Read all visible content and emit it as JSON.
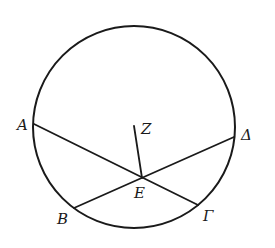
{
  "diagram": {
    "type": "geometry",
    "stroke_color": "#1a1a1a",
    "background": "#ffffff",
    "circle": {
      "cx": 134,
      "cy": 127,
      "r": 101
    },
    "points": {
      "A": {
        "label": "A",
        "x": 34,
        "y": 124,
        "lx": 17,
        "ly": 130
      },
      "B": {
        "label": "B",
        "x": 74,
        "y": 208,
        "lx": 57,
        "ly": 224
      },
      "Gamma": {
        "label": "Γ",
        "x": 198,
        "y": 205,
        "lx": 203,
        "ly": 221
      },
      "Delta": {
        "label": "Δ",
        "x": 234,
        "y": 137,
        "lx": 241,
        "ly": 140
      },
      "E": {
        "label": "E",
        "x": 142,
        "y": 178,
        "lx": 134,
        "ly": 198
      },
      "Z": {
        "label": "Z",
        "x": 134,
        "y": 126,
        "lx": 141,
        "ly": 134
      }
    },
    "segments": [
      {
        "name": "chord-a-gamma",
        "from": "A",
        "to": "Gamma"
      },
      {
        "name": "chord-b-delta",
        "from": "B",
        "to": "Delta"
      },
      {
        "name": "segment-z-e",
        "from": "Z",
        "to": "E"
      }
    ]
  }
}
